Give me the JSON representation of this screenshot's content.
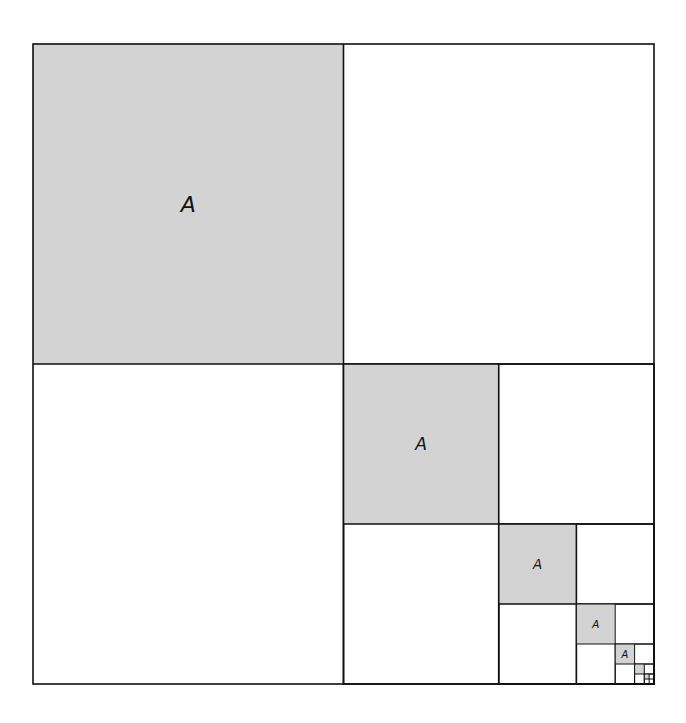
{
  "diagram": {
    "outer": {
      "x": 33,
      "y": 44,
      "w": 621,
      "h": 640
    },
    "fill_color": "#d3d3d3",
    "line_color": "#111111",
    "label": "A",
    "levels": 7,
    "labeled_levels": 5
  }
}
